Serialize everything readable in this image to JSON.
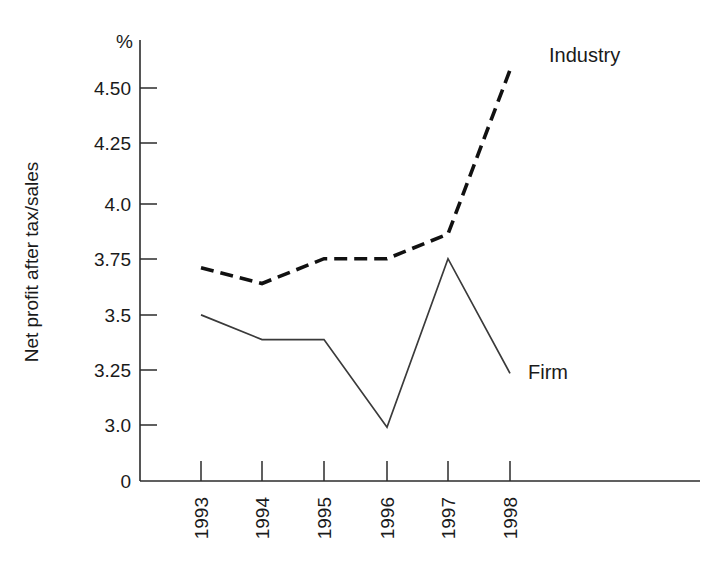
{
  "chart_data": {
    "type": "line",
    "title": "",
    "subtitle": "",
    "xlabel": "",
    "ylabel": "Net profit after tax/sales",
    "yunit": "%",
    "categories": [
      "1993",
      "1994",
      "1995",
      "1996",
      "1997",
      "1998"
    ],
    "ytick_labels": [
      "0",
      "3.0",
      "3.25",
      "3.5",
      "3.75",
      "4.0",
      "4.25",
      "4.50"
    ],
    "ytick_values": [
      0,
      3.0,
      3.25,
      3.5,
      3.75,
      4.0,
      4.25,
      4.5
    ],
    "ylim": [
      2.9,
      4.62
    ],
    "grid": false,
    "legend_position": "inline-right",
    "axis_break": true,
    "series": [
      {
        "name": "Industry",
        "style": "dashed",
        "color": "#111111",
        "values": [
          3.7,
          3.63,
          3.74,
          3.74,
          3.85,
          4.58
        ]
      },
      {
        "name": "Firm",
        "style": "solid",
        "color": "#3a3a3a",
        "values": [
          3.49,
          3.38,
          3.38,
          2.99,
          3.74,
          3.23
        ]
      }
    ],
    "annotations": [
      {
        "text": "Industry",
        "series": "Industry"
      },
      {
        "text": "Firm",
        "series": "Firm"
      }
    ]
  },
  "layout": {
    "plot_left": 140,
    "plot_right": 540,
    "plot_top": 40,
    "plot_bottom": 481,
    "x_positions": [
      201,
      262,
      324,
      387,
      448,
      510
    ],
    "y_pixels": {
      "0": 481,
      "3.0": 425,
      "3.25": 370,
      "3.5": 315,
      "3.75": 259,
      "4.0": 204,
      "4.25": 143,
      "4.50": 88
    },
    "industry_label_xy": [
      549,
      62
    ],
    "firm_label_xy": [
      528,
      372
    ]
  }
}
